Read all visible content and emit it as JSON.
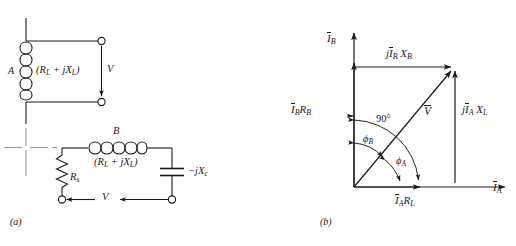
{
  "figure": {
    "panel_a": {
      "caption": "(a)",
      "circuit_top": {
        "coil_label": "A",
        "impedance_label": "(R_L + jX_L)",
        "impedance_parts": {
          "open": "(",
          "r": "R",
          "r_sub": "L",
          "plus": " + ",
          "j": "j",
          "x": "X",
          "x_sub": "L",
          "close": ")"
        },
        "voltage_label": "V",
        "terminal_count": 2
      },
      "circuit_bottom": {
        "coil_label": "B",
        "impedance_label": "(R_L + jX_L)",
        "impedance_parts": {
          "open": "(",
          "r": "R",
          "r_sub": "L",
          "plus": " + ",
          "j": "j",
          "x": "X",
          "x_sub": "L",
          "close": ")"
        },
        "series_resistor_label": "R",
        "series_resistor_sub": "s",
        "capacitor_label": "-jX_c",
        "capacitor_parts": {
          "minus": "−",
          "j": "j",
          "x": "X",
          "x_sub": "c"
        },
        "voltage_label": "V",
        "terminal_count": 2
      }
    },
    "panel_b": {
      "caption": "(b)",
      "axis_vertical_label": {
        "symbol": "I",
        "sub": "B"
      },
      "axis_horizontal_label": {
        "symbol": "I",
        "sub": "A"
      },
      "phasors": [
        {
          "name": "jI_B X_B",
          "parts": {
            "j": "j",
            "i": "I",
            "i_sub": "B",
            "x": " X",
            "x_sub": "B"
          },
          "position": "top"
        },
        {
          "name": "I_B R_B",
          "parts": {
            "i": "I",
            "i_sub": "B",
            "r": "R",
            "r_sub": "B"
          },
          "position": "left"
        },
        {
          "name": "jI_A X_L",
          "parts": {
            "j": "j",
            "i": "I",
            "i_sub": "A",
            "x": " X",
            "x_sub": "L"
          },
          "position": "right"
        },
        {
          "name": "I_A R_L",
          "parts": {
            "i": "I",
            "i_sub": "A",
            "r": "R",
            "r_sub": "L"
          },
          "position": "bottom"
        },
        {
          "name": "V",
          "parts": {
            "v": "V"
          },
          "position": "diagonal"
        }
      ],
      "angles": [
        {
          "label": "90°",
          "name": "right-angle"
        },
        {
          "label": "ϕ",
          "sub": "B",
          "name": "phi-b"
        },
        {
          "label": "ϕ",
          "sub": "A",
          "name": "phi-a"
        }
      ]
    }
  },
  "colors": {
    "ink": "#1a1a1a",
    "background": "#ffffff"
  }
}
